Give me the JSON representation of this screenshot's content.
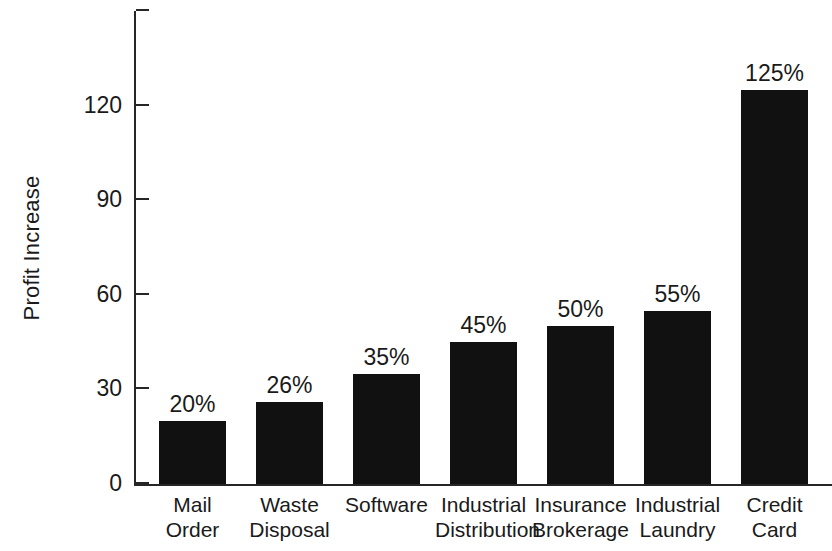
{
  "chart_data": {
    "type": "bar",
    "title": "",
    "xlabel": "",
    "ylabel": "Profit Increase",
    "ylim": [
      0,
      150
    ],
    "yticks": [
      0,
      30,
      60,
      90,
      120,
      150
    ],
    "ytick_labels": [
      "0",
      "30",
      "60",
      "90",
      "120",
      ""
    ],
    "grid": false,
    "legend": null,
    "bar_color": "#111111",
    "axis_color": "#262626",
    "background": "#ffffff",
    "categories": [
      "Mail Order",
      "Waste Disposal",
      "Software",
      "Industrial Distribution",
      "Insurance Brokerage",
      "Industrial Laundry",
      "Credit Card"
    ],
    "category_lines": [
      [
        "Mail",
        "Order"
      ],
      [
        "Waste",
        "Disposal"
      ],
      [
        "Software",
        ""
      ],
      [
        "Industrial",
        "Distribution"
      ],
      [
        "Insurance",
        "Brokerage"
      ],
      [
        "Industrial",
        "Laundry"
      ],
      [
        "Credit",
        "Card"
      ]
    ],
    "values": [
      20,
      26,
      35,
      45,
      50,
      55,
      125
    ],
    "value_labels": [
      "20%",
      "26%",
      "35%",
      "45%",
      "50%",
      "55%",
      "125%"
    ]
  }
}
